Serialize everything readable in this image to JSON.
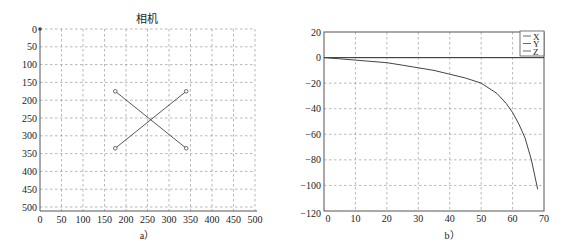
{
  "chart_data": [
    {
      "type": "scatter",
      "title": "相机",
      "caption": "a）",
      "xlabel": "",
      "ylabel": "",
      "xlim": [
        0,
        500
      ],
      "ylim": [
        500,
        0
      ],
      "y_inverted": true,
      "grid": true,
      "x_ticks": [
        0,
        50,
        100,
        150,
        200,
        250,
        300,
        350,
        400,
        450,
        500
      ],
      "y_ticks": [
        0,
        50,
        100,
        150,
        200,
        250,
        300,
        350,
        400,
        450,
        500
      ],
      "origin_marker": {
        "x": 0,
        "y": 0
      },
      "points": [
        {
          "x": 175,
          "y": 175
        },
        {
          "x": 340,
          "y": 175
        },
        {
          "x": 175,
          "y": 335
        },
        {
          "x": 340,
          "y": 335
        }
      ],
      "segments": [
        {
          "from": {
            "x": 175,
            "y": 175
          },
          "to": {
            "x": 340,
            "y": 335
          }
        },
        {
          "from": {
            "x": 340,
            "y": 175
          },
          "to": {
            "x": 175,
            "y": 335
          }
        }
      ]
    },
    {
      "type": "line",
      "title": "",
      "caption": "b）",
      "xlabel": "",
      "ylabel": "",
      "xlim": [
        0,
        70
      ],
      "ylim": [
        -120,
        20
      ],
      "grid": true,
      "x_ticks": [
        0,
        10,
        20,
        30,
        40,
        50,
        60,
        70
      ],
      "y_ticks": [
        20,
        0,
        -20,
        -40,
        -60,
        -80,
        -100,
        -120
      ],
      "legend": {
        "position": "upper right",
        "entries": [
          "X",
          "Y",
          "Z"
        ]
      },
      "series": [
        {
          "name": "X",
          "x": [
            0,
            70
          ],
          "values": [
            0,
            0
          ]
        },
        {
          "name": "Y",
          "x": [
            0,
            70
          ],
          "values": [
            0,
            0
          ]
        },
        {
          "name": "Z",
          "x": [
            0,
            5,
            10,
            15,
            20,
            25,
            30,
            35,
            40,
            45,
            50,
            55,
            58,
            60,
            62,
            64,
            66,
            68
          ],
          "values": [
            0,
            -1,
            -2,
            -3,
            -4,
            -6,
            -8,
            -10,
            -13,
            -16,
            -20,
            -28,
            -36,
            -43,
            -52,
            -63,
            -80,
            -103
          ]
        }
      ]
    }
  ]
}
